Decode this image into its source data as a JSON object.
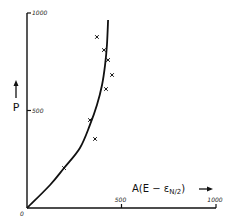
{
  "chart_data": {
    "type": "scatter",
    "title": "",
    "xlabel": "A(E − εN/2)",
    "xlabel_parts": {
      "main": "A(E − ε",
      "subscript": "N/2",
      "close": ")"
    },
    "ylabel": "P",
    "xlim": [
      0,
      1000
    ],
    "ylim": [
      0,
      1000
    ],
    "x_ticks": [
      {
        "value": 500,
        "label": "500"
      },
      {
        "value": 1000,
        "label": "1000"
      }
    ],
    "y_ticks": [
      {
        "value": 500,
        "label": "500"
      },
      {
        "value": 1000,
        "label": "1000"
      }
    ],
    "origin_label": "0",
    "grid": false,
    "legend": null,
    "series": [
      {
        "name": "measured points",
        "marker": "x",
        "points": [
          {
            "x": 370,
            "y": 877
          },
          {
            "x": 407,
            "y": 810
          },
          {
            "x": 429,
            "y": 759
          },
          {
            "x": 450,
            "y": 682
          },
          {
            "x": 418,
            "y": 610
          },
          {
            "x": 333,
            "y": 451
          },
          {
            "x": 360,
            "y": 354
          },
          {
            "x": 196,
            "y": 205
          }
        ]
      },
      {
        "name": "fitted curve",
        "marker": "line",
        "points": [
          {
            "x": 0,
            "y": 0
          },
          {
            "x": 122,
            "y": 118
          },
          {
            "x": 196,
            "y": 205
          },
          {
            "x": 280,
            "y": 308
          },
          {
            "x": 333,
            "y": 426
          },
          {
            "x": 370,
            "y": 528
          },
          {
            "x": 397,
            "y": 631
          },
          {
            "x": 413,
            "y": 733
          },
          {
            "x": 423,
            "y": 836
          },
          {
            "x": 429,
            "y": 964
          }
        ]
      }
    ]
  },
  "layout": {
    "plot_px": {
      "x0": 27,
      "x1000": 216,
      "y0": 208,
      "y1000": 13
    },
    "colors": {
      "ink": "#111111",
      "background": "#ffffff"
    }
  }
}
